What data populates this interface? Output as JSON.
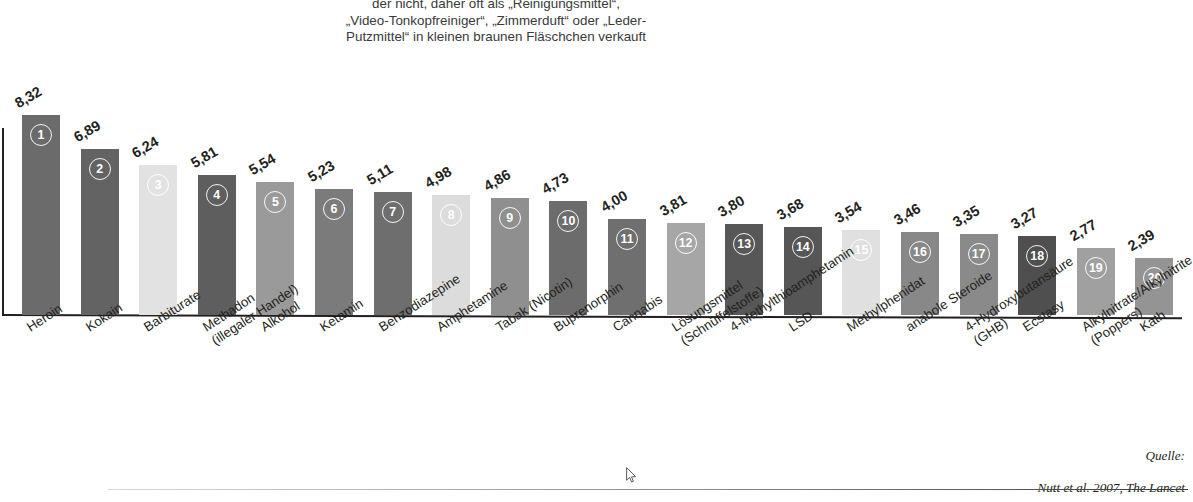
{
  "header": {
    "note": "der nicht, daher oft als „Reinigungsmittel“,\n„Video-Tonkopfreiniger“, „Zimmerduft“ oder „Leder-\nPutzmittel“ in kleinen braunen Fläschchen verkauft"
  },
  "source": {
    "line1": "Quelle:",
    "line2": "Nutt et al. 2007, The Lancet"
  },
  "chart_data": {
    "type": "bar",
    "title": "",
    "xlabel": "",
    "ylabel": "",
    "ylim": [
      0,
      9
    ],
    "grid": false,
    "legend": "none",
    "value_format": "comma-decimal",
    "categories": [
      "Heroin",
      "Kokain",
      "Barbiturate",
      "Methadon\n(illegaler Handel)",
      "Alkohol",
      "Ketamin",
      "Benzodiazepine",
      "Amphetamine",
      "Tabak (Nicotin)",
      "Buprenorphin",
      "Cannabis",
      "Lösungsmittel\n(Schnüffelstoffe)",
      "4-Methylthioamphetamin",
      "LSD",
      "Methylphenidat",
      "anabole Steroide",
      "4-Hydroxybutansäure\n(GHB)",
      "Ecstasy",
      "Alkylnitrate/Alkylnitrite\n(Poppers)",
      "Kath"
    ],
    "values": [
      8.32,
      6.89,
      6.24,
      5.81,
      5.54,
      5.23,
      5.11,
      4.98,
      4.86,
      4.73,
      4.0,
      3.81,
      3.8,
      3.68,
      3.54,
      3.46,
      3.35,
      3.27,
      2.77,
      2.39
    ],
    "value_labels": [
      "8,32",
      "6,89",
      "6,24",
      "5,81",
      "5,54",
      "5,23",
      "5,11",
      "4,98",
      "4,86",
      "4,73",
      "4,00",
      "3,81",
      "3,80",
      "3,68",
      "3,54",
      "3,46",
      "3,35",
      "3,27",
      "2,77",
      "2,39"
    ],
    "ranks": [
      "1",
      "2",
      "3",
      "4",
      "5",
      "6",
      "7",
      "8",
      "9",
      "10",
      "11",
      "12",
      "13",
      "14",
      "15",
      "16",
      "17",
      "18",
      "19",
      "20"
    ],
    "colors": [
      "#6b6b6b",
      "#636363",
      "#e2e2e2",
      "#5e5e5e",
      "#9a9a9a",
      "#7b7b7b",
      "#6e6e6e",
      "#dcdcdc",
      "#8f8f8f",
      "#6c6c6c",
      "#6f6f6f",
      "#a6a6a6",
      "#575757",
      "#565656",
      "#e0e0e0",
      "#888888",
      "#8a8a8a",
      "#4f4f4f",
      "#a0a0a0",
      "#949494"
    ]
  }
}
